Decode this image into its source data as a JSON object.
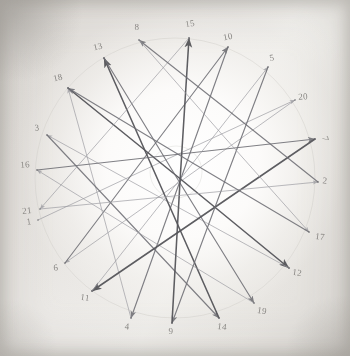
{
  "document": {
    "kind": "hand-drawn-star-polygon-diagram",
    "medium": "pencil on paper (photographed)",
    "title": "",
    "paper_color": "#f0eeeb",
    "ink_color": "#5a5a5c",
    "light_ink_color": "#9a9a9e",
    "label_color": "#7d7b78"
  },
  "chart_data": {
    "type": "scatter",
    "title": "",
    "xlabel": "",
    "ylabel": "",
    "grid": false,
    "legend": null,
    "vertex_count": 21,
    "circle_center": [
      175,
      178
    ],
    "circle_radius": 140,
    "vertices": [
      {
        "label": "1",
        "x": 38,
        "y": 220,
        "label_x": 29,
        "label_y": 222,
        "rot": -8
      },
      {
        "label": "2",
        "x": 318,
        "y": 182,
        "label_x": 325,
        "label_y": 181,
        "rot": 6
      },
      {
        "label": "3",
        "x": 47,
        "y": 135,
        "label_x": 37,
        "label_y": 128,
        "rot": -4
      },
      {
        "label": "4",
        "x": 131,
        "y": 318,
        "label_x": 127,
        "label_y": 327,
        "rot": 4
      },
      {
        "label": "5",
        "x": 268,
        "y": 67,
        "label_x": 272,
        "label_y": 58,
        "rot": -10
      },
      {
        "label": "6",
        "x": 65,
        "y": 263,
        "label_x": 56,
        "label_y": 268,
        "rot": -6
      },
      {
        "label": "7",
        "x": 315,
        "y": 139,
        "label_x": 325,
        "label_y": 139,
        "rot": 75
      },
      {
        "label": "8",
        "x": 139,
        "y": 40,
        "label_x": 137,
        "label_y": 27,
        "rot": 0
      },
      {
        "label": "9",
        "x": 172,
        "y": 323,
        "label_x": 171,
        "label_y": 331,
        "rot": 0
      },
      {
        "label": "10",
        "x": 228,
        "y": 47,
        "label_x": 228,
        "label_y": 37,
        "rot": -12
      },
      {
        "label": "11",
        "x": 92,
        "y": 291,
        "label_x": 85,
        "label_y": 298,
        "rot": 8
      },
      {
        "label": "12",
        "x": 289,
        "y": 268,
        "label_x": 297,
        "label_y": 273,
        "rot": 8
      },
      {
        "label": "13",
        "x": 104,
        "y": 58,
        "label_x": 98,
        "label_y": 47,
        "rot": -14
      },
      {
        "label": "14",
        "x": 219,
        "y": 318,
        "label_x": 222,
        "label_y": 327,
        "rot": 6
      },
      {
        "label": "15",
        "x": 189,
        "y": 38,
        "label_x": 190,
        "label_y": 24,
        "rot": -10
      },
      {
        "label": "16",
        "x": 37,
        "y": 170,
        "label_x": 25,
        "label_y": 165,
        "rot": -4
      },
      {
        "label": "17",
        "x": 309,
        "y": 232,
        "label_x": 320,
        "label_y": 237,
        "rot": 6
      },
      {
        "label": "18",
        "x": 68,
        "y": 88,
        "label_x": 58,
        "label_y": 78,
        "rot": -14
      },
      {
        "label": "19",
        "x": 254,
        "y": 303,
        "label_x": 262,
        "label_y": 311,
        "rot": 10
      },
      {
        "label": "20",
        "x": 295,
        "y": 100,
        "label_x": 303,
        "label_y": 97,
        "rot": -4
      },
      {
        "label": "21",
        "x": 40,
        "y": 209,
        "label_x": 27,
        "label_y": 211,
        "rot": -6
      }
    ],
    "edges": [
      {
        "from": "1",
        "to": "20",
        "weight": "light"
      },
      {
        "from": "20",
        "to": "6",
        "weight": "light"
      },
      {
        "from": "6",
        "to": "10",
        "weight": "medium"
      },
      {
        "from": "10",
        "to": "4",
        "weight": "medium"
      },
      {
        "from": "4",
        "to": "18",
        "weight": "light"
      },
      {
        "from": "18",
        "to": "12",
        "weight": "dark"
      },
      {
        "from": "12",
        "to": "3",
        "weight": "light"
      },
      {
        "from": "3",
        "to": "14",
        "weight": "medium"
      },
      {
        "from": "14",
        "to": "13",
        "weight": "dark"
      },
      {
        "from": "13",
        "to": "19",
        "weight": "medium"
      },
      {
        "from": "19",
        "to": "16",
        "weight": "light"
      },
      {
        "from": "16",
        "to": "7",
        "weight": "medium"
      },
      {
        "from": "7",
        "to": "11",
        "weight": "dark"
      },
      {
        "from": "11",
        "to": "5",
        "weight": "light"
      },
      {
        "from": "5",
        "to": "9",
        "weight": "medium"
      },
      {
        "from": "9",
        "to": "15",
        "weight": "dark"
      },
      {
        "from": "15",
        "to": "21",
        "weight": "light"
      },
      {
        "from": "21",
        "to": "2",
        "weight": "light"
      },
      {
        "from": "2",
        "to": "8",
        "weight": "medium"
      },
      {
        "from": "8",
        "to": "17",
        "weight": "light"
      },
      {
        "from": "17",
        "to": "18",
        "weight": "medium"
      }
    ]
  }
}
